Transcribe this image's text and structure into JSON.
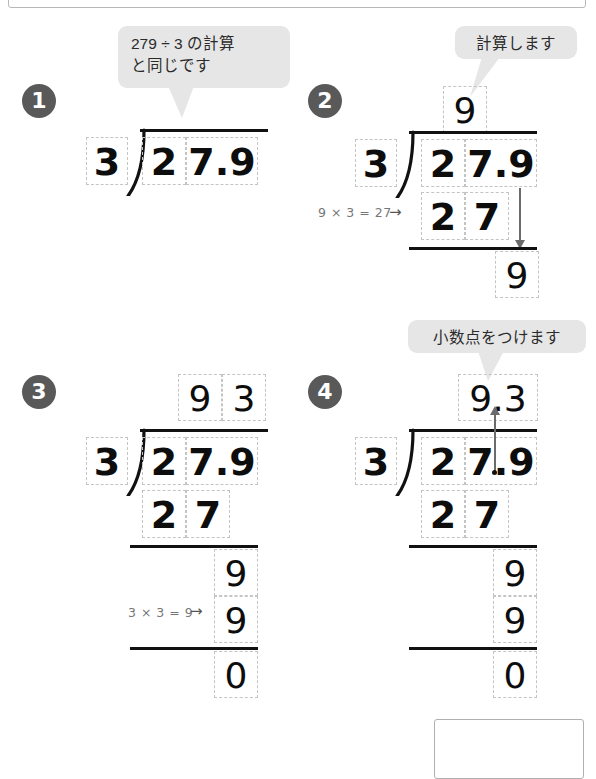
{
  "page": {
    "topic": "小数のわり算 ひっ算",
    "problem": "27.9 ÷ 3",
    "divisor": "3",
    "dividend": "27.9",
    "quotient": "9.3"
  },
  "steps": [
    {
      "number": "1",
      "bubble": "279 ÷ 3 の計算\nと同じです",
      "divisor": "3",
      "dividend": [
        "2",
        "7.9"
      ],
      "quotient": [],
      "work": [],
      "hint": ""
    },
    {
      "number": "2",
      "bubble": "計算します",
      "divisor": "3",
      "dividend": [
        "2",
        "7.9"
      ],
      "quotient": [
        "9"
      ],
      "work": [
        "2",
        "7"
      ],
      "remainder": "9",
      "hint": "9 × 3 = 27"
    },
    {
      "number": "3",
      "bubble": "",
      "divisor": "3",
      "dividend": [
        "2",
        "7.9"
      ],
      "quotient": [
        "9",
        "3"
      ],
      "work": [
        "2",
        "7"
      ],
      "bring_down": "9",
      "subtrahend": "9",
      "remainder": "0",
      "hint": "3 × 3 = 9"
    },
    {
      "number": "4",
      "bubble": "小数点をつけます",
      "divisor": "3",
      "dividend": [
        "2",
        "7.9"
      ],
      "quotient": [
        "9.3"
      ],
      "work": [
        "2",
        "7"
      ],
      "bring_down": "9",
      "subtrahend": "9",
      "remainder": "0",
      "hint": ""
    }
  ],
  "symbols": {
    "arrow_right": "→",
    "divide": "÷",
    "times": "×",
    "equals": "="
  },
  "colors": {
    "badge_bg": "#595959",
    "bubble_bg": "#e6e6e6",
    "cell_border": "#c4c4c4",
    "rule": "#111111",
    "arrow": "#6b6b6b",
    "hint_text": "#777777"
  }
}
